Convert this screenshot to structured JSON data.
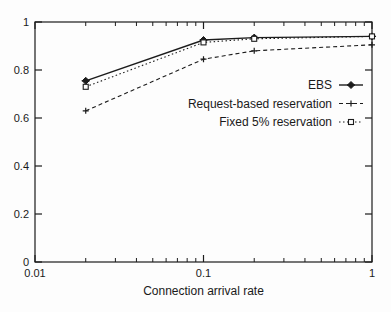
{
  "figure": {
    "background": "#fdfdfd",
    "axis_color": "#1c1c1c",
    "text_color": "#1a1a1a"
  },
  "chart_data": {
    "type": "line",
    "title": "",
    "xlabel": "Connection arrival rate",
    "ylabel": "",
    "x_scale": "log",
    "xlim": [
      0.01,
      1
    ],
    "ylim": [
      0,
      1
    ],
    "grid": false,
    "legend_position": "middle-right",
    "x_ticks": [
      {
        "value": 0.01,
        "label": "0.01"
      },
      {
        "value": 0.1,
        "label": "0.1"
      },
      {
        "value": 1,
        "label": "1"
      }
    ],
    "y_ticks": [
      {
        "value": 0,
        "label": "0"
      },
      {
        "value": 0.2,
        "label": "0.2"
      },
      {
        "value": 0.4,
        "label": "0.4"
      },
      {
        "value": 0.6,
        "label": "0.6"
      },
      {
        "value": 0.8,
        "label": "0.8"
      },
      {
        "value": 1,
        "label": "1"
      }
    ],
    "x": [
      0.02,
      0.1,
      0.2,
      1
    ],
    "series": [
      {
        "name": "EBS",
        "values": [
          0.755,
          0.925,
          0.935,
          0.94
        ],
        "line": "solid",
        "marker": "filled-diamond",
        "color": "#1c1c1c"
      },
      {
        "name": "Request-based reservation",
        "values": [
          0.63,
          0.845,
          0.88,
          0.905
        ],
        "line": "dashed",
        "marker": "plus",
        "color": "#1c1c1c"
      },
      {
        "name": "Fixed 5% reservation",
        "values": [
          0.73,
          0.915,
          0.93,
          0.94
        ],
        "line": "dotted",
        "marker": "open-square",
        "color": "#1c1c1c"
      }
    ]
  }
}
